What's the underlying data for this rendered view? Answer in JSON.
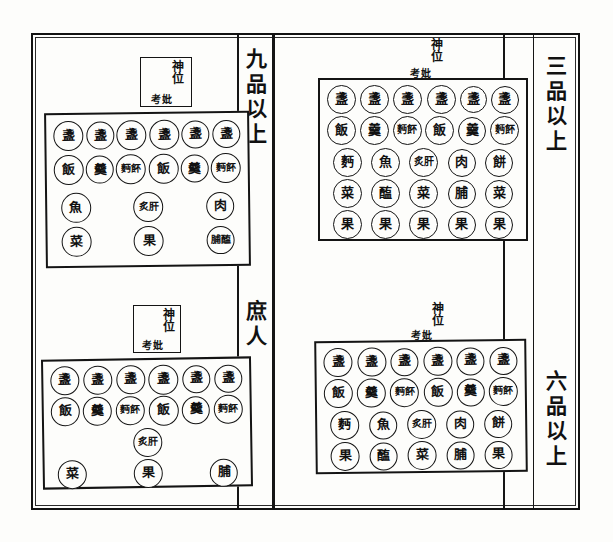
{
  "page": {
    "background_color": "#fdfdfb",
    "ink_color": "#111111"
  },
  "rank_labels": {
    "upper_left": "九品以上",
    "lower_left": "庶人",
    "upper_right": "三品以上",
    "lower_right": "六品以上"
  },
  "tablet": {
    "main": "神位",
    "left_small": "妣",
    "right_small": "考"
  },
  "diagrams": [
    {
      "id": "upper-left",
      "rank": "九品以上",
      "position": "top-left",
      "rows": [
        {
          "count": 6,
          "items": [
            "盞",
            "盞",
            "盞",
            "盞",
            "盞",
            "盞"
          ]
        },
        {
          "count": 6,
          "items": [
            "飯",
            "羹",
            "麪䬪",
            "飯",
            "羹",
            "麪䬪"
          ]
        },
        {
          "count": 3,
          "items": [
            "魚",
            "炙肝",
            "肉"
          ]
        },
        {
          "count": 3,
          "items": [
            "菜",
            "果",
            "脯醢"
          ]
        }
      ]
    },
    {
      "id": "upper-right",
      "rank": "三品以上",
      "position": "top-right",
      "rows": [
        {
          "count": 6,
          "items": [
            "盞",
            "盞",
            "盞",
            "盞",
            "盞",
            "盞"
          ]
        },
        {
          "count": 6,
          "items": [
            "飯",
            "羹",
            "麪䬪",
            "飯",
            "羹",
            "麪䬪"
          ]
        },
        {
          "count": 5,
          "items": [
            "麪",
            "魚",
            "炙肝",
            "肉",
            "餅"
          ]
        },
        {
          "count": 5,
          "items": [
            "菜",
            "醢",
            "菜",
            "脯",
            "菜"
          ]
        },
        {
          "count": 5,
          "items": [
            "果",
            "果",
            "果",
            "果",
            "果"
          ]
        }
      ]
    },
    {
      "id": "lower-left",
      "rank": "庶人",
      "position": "bottom-left",
      "rows": [
        {
          "count": 6,
          "items": [
            "盞",
            "盞",
            "盞",
            "盞",
            "盞",
            "盞"
          ]
        },
        {
          "count": 6,
          "items": [
            "飯",
            "羹",
            "麪䬪",
            "飯",
            "羹",
            "麪䬪"
          ]
        },
        {
          "count": 1,
          "items": [
            "炙肝"
          ]
        },
        {
          "count": 3,
          "items": [
            "菜",
            "果",
            "脯"
          ]
        }
      ]
    },
    {
      "id": "lower-right",
      "rank": "六品以上",
      "position": "bottom-right",
      "rows": [
        {
          "count": 6,
          "items": [
            "盞",
            "盞",
            "盞",
            "盞",
            "盞",
            "盞"
          ]
        },
        {
          "count": 6,
          "items": [
            "飯",
            "羹",
            "麪䬪",
            "飯",
            "羹",
            "麪䬪"
          ]
        },
        {
          "count": 5,
          "items": [
            "麪",
            "魚",
            "炙肝",
            "肉",
            "餅"
          ]
        },
        {
          "count": 5,
          "items": [
            "果",
            "醢",
            "菜",
            "脯",
            "果"
          ]
        }
      ]
    }
  ]
}
